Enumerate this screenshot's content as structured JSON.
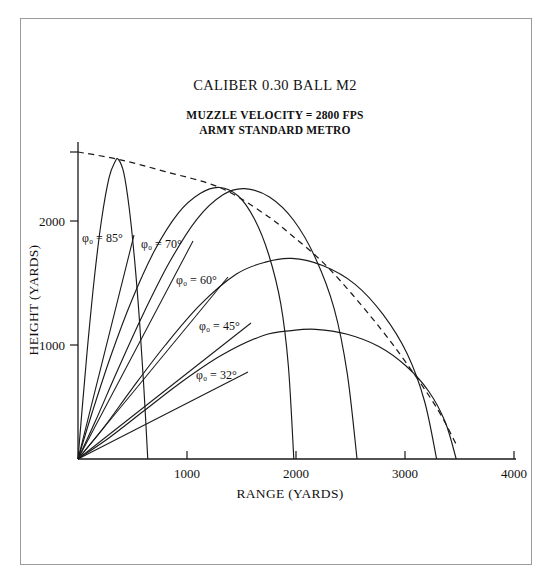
{
  "figure": {
    "title": "CALIBER 0.30 BALL M2",
    "subtitle_line1": "MUZZLE VELOCITY = 2800 FPS",
    "subtitle_line2": "ARMY STANDARD METRO",
    "frame_color": "#9a9a9a",
    "line_color": "#1a1a1a",
    "background": "#ffffff"
  },
  "chart_data": {
    "type": "line",
    "title": "CALIBER 0.30 BALL M2",
    "subtitle": "MUZZLE VELOCITY = 2800 FPS / ARMY STANDARD METRO",
    "xlabel": "RANGE (YARDS)",
    "ylabel": "HEIGHT (YARDS)",
    "xlim": [
      0,
      4000
    ],
    "ylim": [
      0,
      2560
    ],
    "xticks": [
      0,
      1000,
      2000,
      3000,
      4000
    ],
    "xtick_labels": [
      "",
      "1000",
      "2000",
      "3000",
      "4000"
    ],
    "yticks": [
      1000,
      2000
    ],
    "ytick_labels": [
      "1000",
      "2000"
    ],
    "grid": false,
    "legend": "inline-annotations",
    "series": [
      {
        "name": "phi0 = 85",
        "label": "φ₀ = 85°",
        "angle_deg": 85,
        "max_height": 2450,
        "max_height_range": 370,
        "impact_range": 640,
        "points_x": [
          0,
          40,
          90,
          150,
          215,
          285,
          340,
          370,
          420,
          470,
          520,
          565,
          605,
          640
        ],
        "points_y": [
          0,
          430,
          940,
          1480,
          1950,
          2300,
          2430,
          2450,
          2340,
          2050,
          1620,
          1120,
          570,
          0
        ]
      },
      {
        "name": "phi0 = 70",
        "label": "φ₀ = 70°",
        "angle_deg": 70,
        "max_height": 2220,
        "max_height_range": 1300,
        "impact_range": 1980,
        "points_x": [
          0,
          130,
          300,
          490,
          700,
          920,
          1120,
          1300,
          1470,
          1620,
          1750,
          1860,
          1930,
          1980
        ],
        "points_y": [
          0,
          380,
          840,
          1290,
          1700,
          2010,
          2170,
          2220,
          2150,
          1960,
          1670,
          1270,
          760,
          0
        ]
      },
      {
        "name": "phi0 = 60",
        "label": "φ₀ = 60°",
        "angle_deg": 60,
        "max_height": 2210,
        "max_height_range": 1530,
        "impact_range": 2560,
        "points_x": [
          0,
          160,
          360,
          590,
          840,
          1090,
          1330,
          1530,
          1760,
          1980,
          2180,
          2350,
          2470,
          2560
        ],
        "points_y": [
          0,
          310,
          720,
          1170,
          1610,
          1960,
          2160,
          2210,
          2140,
          1950,
          1640,
          1230,
          700,
          0
        ]
      },
      {
        "name": "phi0 = 45",
        "label": "φ₀ = 45°",
        "angle_deg": 45,
        "max_height": 1640,
        "max_height_range": 1960,
        "impact_range": 3290,
        "points_x": [
          0,
          230,
          500,
          800,
          1120,
          1450,
          1720,
          1960,
          2250,
          2540,
          2800,
          3020,
          3180,
          3290
        ],
        "points_y": [
          0,
          250,
          580,
          930,
          1260,
          1510,
          1610,
          1640,
          1580,
          1430,
          1180,
          860,
          470,
          0
        ]
      },
      {
        "name": "phi0 = 32",
        "label": "φ₀ = 32°",
        "angle_deg": 32,
        "max_height": 1060,
        "max_height_range": 2180,
        "impact_range": 3470,
        "points_x": [
          0,
          280,
          600,
          950,
          1320,
          1700,
          1960,
          2180,
          2470,
          2760,
          3010,
          3220,
          3370,
          3470
        ],
        "points_y": [
          0,
          170,
          390,
          630,
          850,
          1010,
          1050,
          1060,
          1020,
          920,
          760,
          550,
          300,
          0
        ]
      }
    ],
    "envelope": {
      "name": "maximum-ordinate-envelope",
      "style": "dashed",
      "points_x": [
        0,
        370,
        800,
        1300,
        1700,
        1960,
        2300,
        2700,
        3000,
        3290,
        3470
      ],
      "points_y": [
        2510,
        2450,
        2350,
        2220,
        2010,
        1830,
        1560,
        1150,
        800,
        420,
        120
      ]
    },
    "annotations": [
      {
        "label": "φ₀ = 85°",
        "text_x_px": 82,
        "text_y_px": 242,
        "leader_to": "origin"
      },
      {
        "label": "φ₀ = 70°",
        "text_x_px": 141,
        "text_y_px": 248,
        "leader_to": "origin"
      },
      {
        "label": "φ₀ = 60°",
        "text_x_px": 176,
        "text_y_px": 284,
        "leader_to": "origin"
      },
      {
        "label": "φ₀ = 45°",
        "text_x_px": 199,
        "text_y_px": 330,
        "leader_to": "origin"
      },
      {
        "label": "φ₀ = 32°",
        "text_x_px": 196,
        "text_y_px": 379,
        "leader_to": "origin"
      }
    ]
  }
}
